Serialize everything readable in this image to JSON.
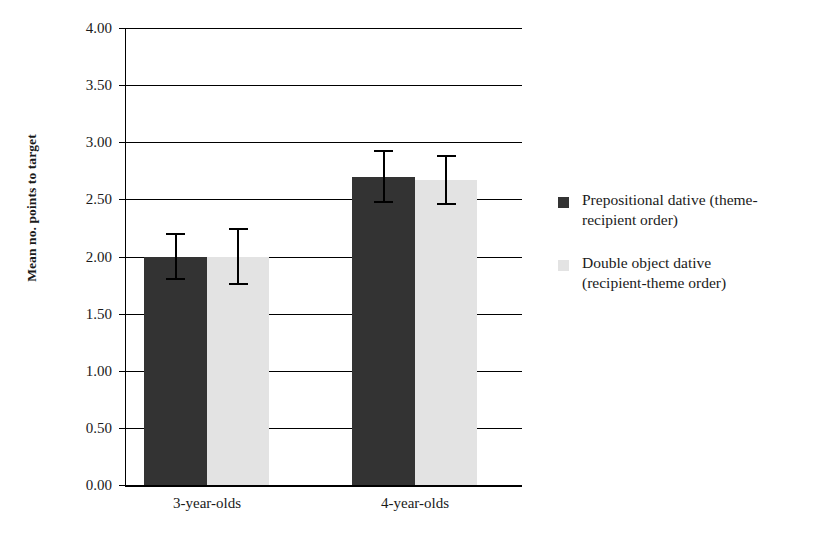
{
  "chart_data": {
    "type": "bar",
    "title": "",
    "subtitle": "",
    "xlabel": "",
    "ylabel": "Mean no. points to target",
    "categories": [
      "3-year-olds",
      "4-year-olds"
    ],
    "ylim": [
      0.0,
      4.0
    ],
    "ytick_values": [
      4.0,
      3.5,
      3.0,
      2.5,
      2.0,
      1.5,
      1.0,
      0.5,
      0.0
    ],
    "ytick_labels": [
      "4.00",
      "3.50",
      "3.00",
      "2.50",
      "2.00",
      "1.50",
      "1.00",
      "0.50",
      "0.00"
    ],
    "grid": "horizontal",
    "legend_position": "right",
    "error_bar_type": "symmetric",
    "series": [
      {
        "name": "Prepositional dative (theme-recipient order)",
        "color": "#333333",
        "values": [
          2.0,
          2.7
        ],
        "errors": [
          0.21,
          0.23
        ]
      },
      {
        "name": "Double object dative (recipient-theme order)",
        "color": "#e3e3e3",
        "values": [
          2.0,
          2.67
        ],
        "errors": [
          0.25,
          0.22
        ]
      }
    ]
  },
  "legend": {
    "items": [
      {
        "label": "Prepositional dative (theme-recipient order)",
        "line1": "Prepositional dative (theme-",
        "line2": "recipient order)",
        "swatch": "dark"
      },
      {
        "label": "Double object dative (recipient-theme order)",
        "line1": "Double object dative",
        "line2": "(recipient-theme order)",
        "swatch": "light"
      }
    ]
  },
  "colors": {
    "series_dark": "#333333",
    "series_light": "#e3e3e3",
    "axis": "#000000",
    "background": "#ffffff",
    "text": "#1a1a1a"
  }
}
